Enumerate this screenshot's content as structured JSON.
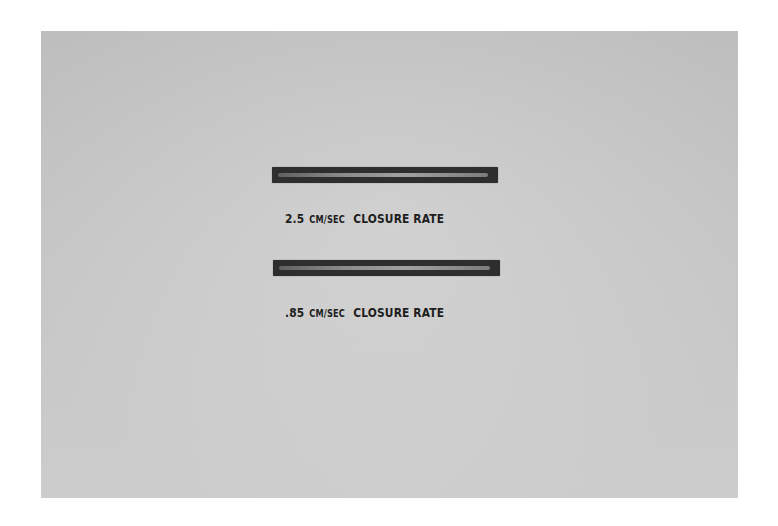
{
  "figure": {
    "background_color": "#c9c9c9",
    "bar_color": "#2e2e2e",
    "items": [
      {
        "value": "2.5",
        "unit": "CM/SEC",
        "label": "CLOSURE RATE"
      },
      {
        "value": ".85",
        "unit": "CM/SEC",
        "label": "CLOSURE RATE"
      }
    ]
  }
}
